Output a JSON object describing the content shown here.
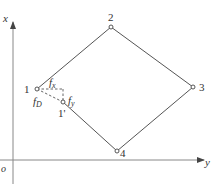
{
  "axes": {
    "vertical_label": "x",
    "horizontal_label": "y",
    "origin_label": "o"
  },
  "nodes": [
    {
      "id": "1",
      "label": "1"
    },
    {
      "id": "2",
      "label": "2"
    },
    {
      "id": "3",
      "label": "3"
    },
    {
      "id": "4",
      "label": "4"
    },
    {
      "id": "1p",
      "label": "1'"
    }
  ],
  "forces": {
    "fx": {
      "base": "f",
      "sub": "x"
    },
    "fy": {
      "base": "f",
      "sub": "y"
    },
    "fd": {
      "base": "f",
      "sub": "D"
    }
  },
  "colors": {
    "line": "#555555",
    "axis": "#888888",
    "text": "#333333"
  }
}
